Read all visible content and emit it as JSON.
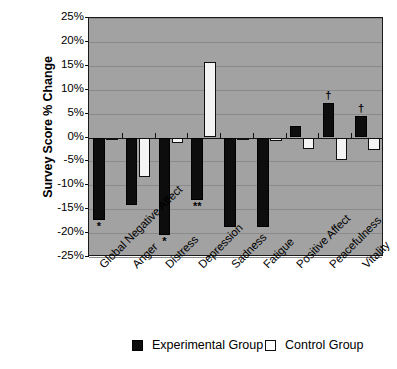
{
  "chart_data": {
    "type": "bar",
    "title": "",
    "subtitle": "",
    "xlabel": "",
    "ylabel": "Survey Score % Change",
    "ylim": [
      -25,
      25
    ],
    "ytick_values": [
      25,
      20,
      15,
      10,
      5,
      0,
      -5,
      -10,
      -15,
      -20,
      -25
    ],
    "ytick_labels": [
      "25%",
      "20%",
      "15%",
      "10%",
      "5%",
      "0%",
      "-5%",
      "-10%",
      "-15%",
      "-20%",
      "-25%"
    ],
    "grid": true,
    "legend_position": "bottom",
    "categories": [
      "Global Negative Affect",
      "Anger",
      "Distress",
      "Depression",
      "Sadness",
      "Fatigue",
      "Positive Affect",
      "Peacefulness",
      "Vitality"
    ],
    "series": [
      {
        "name": "Experimental Group",
        "color": "#0d0d0d",
        "values": [
          -17.3,
          -14.2,
          -20.3,
          -13.0,
          -18.7,
          -18.7,
          2.5,
          7.3,
          4.5
        ]
      },
      {
        "name": "Control Group",
        "color": "#ffffff",
        "values": [
          -0.5,
          -8.3,
          -1.2,
          15.7,
          -0.6,
          -0.8,
          -2.5,
          -4.8,
          -2.7
        ]
      }
    ],
    "annotations": [
      {
        "category": "Global Negative Affect",
        "series": "Experimental Group",
        "marker": "*",
        "placement": "below-bar"
      },
      {
        "category": "Distress",
        "series": "Experimental Group",
        "marker": "*",
        "placement": "below-bar"
      },
      {
        "category": "Depression",
        "series": "Experimental Group",
        "marker": "**",
        "placement": "below-bar"
      },
      {
        "category": "Peacefulness",
        "series": "Experimental Group",
        "marker": "†",
        "placement": "above-bar"
      },
      {
        "category": "Vitality",
        "series": "Experimental Group",
        "marker": "†",
        "placement": "above-bar"
      }
    ],
    "colors": {
      "plot_background": "#a2a2a2",
      "axis": "#151515",
      "gridline": "#8a8a8a",
      "experimental": "#0d0d0d",
      "control": "#ffffff"
    }
  },
  "legend": {
    "entries": [
      {
        "label": "Experimental Group",
        "swatch": "experimental-swatch"
      },
      {
        "label": "Control Group",
        "swatch": "control-swatch"
      }
    ]
  }
}
